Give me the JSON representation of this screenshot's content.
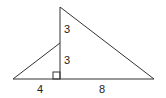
{
  "diagram": {
    "type": "geometry-triangles",
    "stroke_color": "#333333",
    "labels": {
      "upper_vertical": "3",
      "lower_vertical": "3",
      "left_base": "4",
      "right_base": "8"
    },
    "right_angle_marker": true
  }
}
